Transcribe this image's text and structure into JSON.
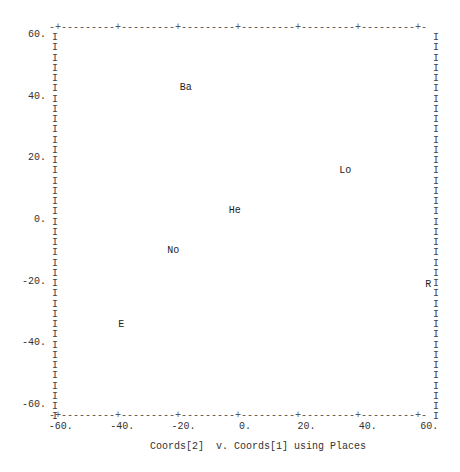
{
  "chart_data": {
    "type": "scatter",
    "title": "",
    "caption": "Coords[2]  v. Coords[1] using Places",
    "xlabel": "Coords[2]",
    "ylabel": "Coords[1]",
    "label_variable": "Places",
    "xlim": [
      -60,
      60
    ],
    "ylim": [
      -60,
      60
    ],
    "x_ticks": [
      "-60.",
      "-40.",
      "-20.",
      "0.",
      "20.",
      "40.",
      "60."
    ],
    "y_ticks": [
      "60.",
      "40.",
      "20.",
      "0.",
      "-20.",
      "-40.",
      "-60."
    ],
    "grid": false,
    "legend": null,
    "points": [
      {
        "label": "Ba",
        "x": -19,
        "y": 43
      },
      {
        "label": "Lo",
        "x": 33,
        "y": 16
      },
      {
        "label": "He",
        "x": -3,
        "y": 3
      },
      {
        "label": "No",
        "x": -23,
        "y": -10
      },
      {
        "label": "R",
        "x": 60,
        "y": -21
      },
      {
        "label": "E",
        "x": -40,
        "y": -34
      }
    ]
  },
  "frame": {
    "top_line": "-+---------+---------+---------+---------+---------+---------+-",
    "bottom_line": "-+---------+---------+---------+---------+---------+---------+-",
    "border_char": "I"
  }
}
